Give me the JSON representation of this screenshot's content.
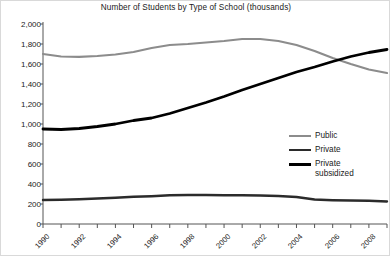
{
  "chart_data": {
    "type": "line",
    "title": "Number of Students by Type of School (thousands)",
    "xlabel": "",
    "ylabel": "",
    "grid": false,
    "legend_position": "right-middle",
    "x": [
      1990,
      1991,
      1992,
      1993,
      1994,
      1995,
      1996,
      1997,
      1998,
      1999,
      2000,
      2001,
      2002,
      2003,
      2004,
      2005,
      2006,
      2007,
      2008,
      2009
    ],
    "xtick_labels": [
      "1990",
      "1992",
      "1994",
      "1996",
      "1998",
      "2000",
      "2002",
      "2004",
      "2006",
      "2008"
    ],
    "xtick_values": [
      1990,
      1992,
      1994,
      1996,
      1998,
      2000,
      2002,
      2004,
      2006,
      2008
    ],
    "ytick_labels": [
      "0",
      "200",
      "400",
      "600",
      "800",
      "1,000",
      "1,200",
      "1,400",
      "1,600",
      "1,800",
      "2,000"
    ],
    "ytick_values": [
      0,
      200,
      400,
      600,
      800,
      1000,
      1200,
      1400,
      1600,
      1800,
      2000
    ],
    "ylim": [
      0,
      2000
    ],
    "xlim": [
      1990,
      2009
    ],
    "series": [
      {
        "name": "Public",
        "color": "#8c8c8c",
        "width": 2.2,
        "values": [
          1700,
          1675,
          1672,
          1680,
          1695,
          1720,
          1760,
          1790,
          1800,
          1815,
          1830,
          1850,
          1850,
          1830,
          1790,
          1730,
          1660,
          1600,
          1545,
          1510
        ]
      },
      {
        "name": "Private",
        "color": "#2b2b2b",
        "width": 2.4,
        "values": [
          240,
          243,
          248,
          255,
          262,
          272,
          278,
          288,
          290,
          290,
          288,
          288,
          285,
          280,
          270,
          245,
          238,
          235,
          232,
          225
        ]
      },
      {
        "name": "Private subsidized",
        "color": "#000000",
        "width": 2.8,
        "values": [
          950,
          945,
          955,
          975,
          1000,
          1035,
          1060,
          1105,
          1160,
          1215,
          1275,
          1340,
          1400,
          1460,
          1520,
          1570,
          1625,
          1675,
          1715,
          1745
        ]
      }
    ]
  },
  "legend": {
    "items": [
      {
        "label": "Public"
      },
      {
        "label": "Private"
      },
      {
        "label": "Private\nsubsidized"
      }
    ]
  }
}
